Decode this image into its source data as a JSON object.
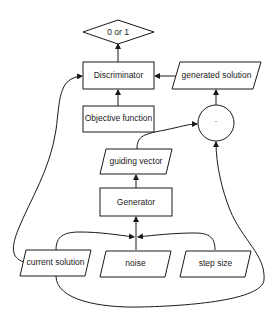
{
  "diagram": {
    "type": "flowchart",
    "nodes": {
      "output": {
        "label": "0 or 1",
        "shape": "diamond"
      },
      "discriminator": {
        "label": "Discriminator",
        "shape": "rectangle"
      },
      "objective": {
        "label": "Objective function",
        "shape": "rectangle"
      },
      "generated_solution": {
        "label": "generated solution",
        "shape": "parallelogram"
      },
      "multiply": {
        "label": "·",
        "shape": "circle"
      },
      "guiding_vector": {
        "label": "guiding vector",
        "shape": "parallelogram"
      },
      "generator": {
        "label": "Generator",
        "shape": "rectangle"
      },
      "current_solution": {
        "label": "current solution",
        "shape": "parallelogram"
      },
      "noise": {
        "label": "noise",
        "shape": "parallelogram"
      },
      "step_size": {
        "label": "step size",
        "shape": "parallelogram"
      }
    },
    "edges": [
      {
        "from": "discriminator",
        "to": "output"
      },
      {
        "from": "objective",
        "to": "discriminator"
      },
      {
        "from": "generated_solution",
        "to": "discriminator"
      },
      {
        "from": "multiply",
        "to": "generated_solution"
      },
      {
        "from": "guiding_vector",
        "to": "multiply"
      },
      {
        "from": "generator",
        "to": "guiding_vector"
      },
      {
        "from": "current_solution",
        "to": "generator"
      },
      {
        "from": "noise",
        "to": "generator"
      },
      {
        "from": "step_size",
        "to": "generator"
      },
      {
        "from": "current_solution",
        "to": "discriminator"
      },
      {
        "from": "current_solution",
        "to": "multiply"
      }
    ]
  }
}
